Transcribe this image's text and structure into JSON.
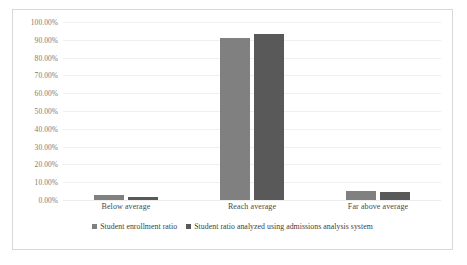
{
  "chart_data": {
    "type": "bar",
    "title": "",
    "subtitle": "",
    "xlabel": "",
    "ylabel": "",
    "categories": [
      "Below average",
      "Reach average",
      "Far above average"
    ],
    "series": [
      {
        "name": "Student enrollment ratio",
        "color": "#808080",
        "values": [
          3.0,
          91.0,
          5.0
        ]
      },
      {
        "name": "Student ratio analyzed using admissions analysis system",
        "color": "#595959",
        "values": [
          1.5,
          93.0,
          4.5
        ]
      }
    ],
    "ylim": [
      0,
      100
    ],
    "ytick_values": [
      0,
      10,
      20,
      30,
      40,
      50,
      60,
      70,
      80,
      90,
      100
    ],
    "ytick_labels": [
      "0.00%",
      "10.00%",
      "20.00%",
      "30.00%",
      "40.00%",
      "50.00%",
      "60.00%",
      "70.00%",
      "80.00%",
      "90.00%",
      "100.00%"
    ],
    "value_format": "percent",
    "grid": {
      "horizontal": true,
      "vertical": false,
      "color": "#f0f0f0"
    },
    "legend": {
      "position": "bottom-center",
      "orientation": "horizontal",
      "marker": "square"
    },
    "frame": {
      "border": true,
      "border_color": "#d8d8d8",
      "background": "#ffffff"
    }
  }
}
